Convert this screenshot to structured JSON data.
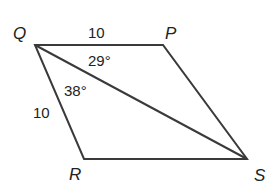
{
  "figure": {
    "type": "parallelogram-with-diagonal",
    "stroke_color": "#3a3a3a",
    "text_color": "#222222",
    "background": "#ffffff"
  },
  "vertices": {
    "Q": {
      "label": "Q",
      "x": 35,
      "y": 45
    },
    "P": {
      "label": "P",
      "x": 163,
      "y": 45
    },
    "S": {
      "label": "S",
      "x": 247,
      "y": 159
    },
    "R": {
      "label": "R",
      "x": 84,
      "y": 159
    }
  },
  "sides": [
    {
      "from": "Q",
      "to": "P"
    },
    {
      "from": "P",
      "to": "S"
    },
    {
      "from": "S",
      "to": "R"
    },
    {
      "from": "R",
      "to": "Q"
    }
  ],
  "diagonal": {
    "from": "Q",
    "to": "S"
  },
  "measurements": {
    "side_QP": "10",
    "side_QR": "10",
    "angle_PQS": "29°",
    "angle_RQS": "38°"
  }
}
